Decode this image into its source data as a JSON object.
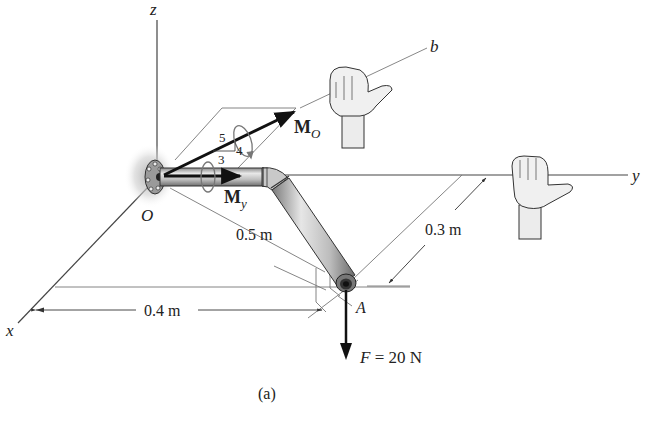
{
  "figure": {
    "caption": "(a)",
    "axes": {
      "x": "x",
      "y": "y",
      "z": "z",
      "b": "b"
    },
    "points": {
      "origin": "O",
      "end": "A"
    },
    "moments": {
      "mo": {
        "symbol": "M",
        "subscript": "O"
      },
      "my": {
        "symbol": "M",
        "subscript": "y"
      }
    },
    "slope_triangle": {
      "hyp": "5",
      "adj": "4",
      "opp": "3"
    },
    "dimensions": {
      "d1": "0.5 m",
      "d2": "0.3 m",
      "d3": "0.4 m"
    },
    "force": {
      "symbol": "F",
      "eq": " = 20 N"
    },
    "colors": {
      "line": "#555555",
      "arrow": "#111111",
      "pipe_light": "#d9d9d9",
      "pipe_dark": "#7a7a7a",
      "halo": "#b8b8b8"
    }
  }
}
